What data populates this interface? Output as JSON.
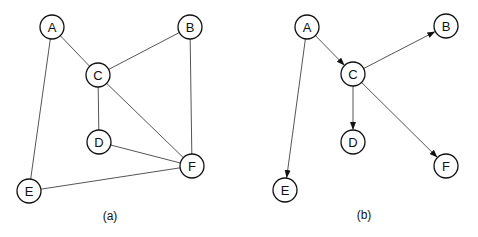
{
  "node_radius": 12,
  "colors": {
    "edge": "#555555",
    "node_stroke": "#111111",
    "background": "#ffffff"
  },
  "graphs": [
    {
      "caption": "(a)",
      "caption_pos": [
        110,
        216
      ],
      "directed": false,
      "nodes": [
        {
          "id": "A",
          "x": 52,
          "y": 27
        },
        {
          "id": "B",
          "x": 190,
          "y": 27
        },
        {
          "id": "C",
          "x": 98,
          "y": 75
        },
        {
          "id": "D",
          "x": 99,
          "y": 142
        },
        {
          "id": "E",
          "x": 29,
          "y": 191
        },
        {
          "id": "F",
          "x": 192,
          "y": 166
        }
      ],
      "edges": [
        [
          "A",
          "C"
        ],
        [
          "A",
          "E"
        ],
        [
          "B",
          "C"
        ],
        [
          "B",
          "F"
        ],
        [
          "C",
          "D"
        ],
        [
          "C",
          "F"
        ],
        [
          "D",
          "F"
        ],
        [
          "E",
          "F"
        ]
      ]
    },
    {
      "caption": "(b)",
      "caption_pos": [
        364,
        215
      ],
      "directed": true,
      "nodes": [
        {
          "id": "A",
          "x": 307,
          "y": 27
        },
        {
          "id": "B",
          "x": 446,
          "y": 26
        },
        {
          "id": "C",
          "x": 353,
          "y": 74
        },
        {
          "id": "D",
          "x": 353,
          "y": 142
        },
        {
          "id": "E",
          "x": 285,
          "y": 190
        },
        {
          "id": "F",
          "x": 446,
          "y": 166
        }
      ],
      "edges": [
        [
          "A",
          "C"
        ],
        [
          "A",
          "E"
        ],
        [
          "C",
          "B"
        ],
        [
          "C",
          "D"
        ],
        [
          "C",
          "F"
        ]
      ]
    }
  ]
}
